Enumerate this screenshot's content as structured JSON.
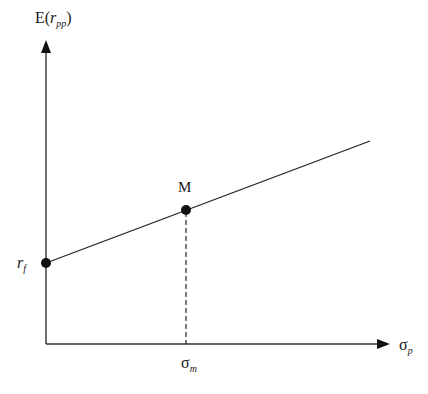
{
  "diagram": {
    "y_axis_label": {
      "main": "E(",
      "var": "r",
      "sub": "pp",
      "close": ")"
    },
    "x_axis_label": {
      "main": "σ",
      "sub": "p"
    },
    "points": {
      "risk_free": {
        "label": "r",
        "sub": "f"
      },
      "market": {
        "label": "M"
      }
    },
    "x_marker": {
      "main": "σ",
      "sub": "m"
    },
    "colors": {
      "line": "#1a1a1a",
      "background": "#ffffff"
    }
  }
}
